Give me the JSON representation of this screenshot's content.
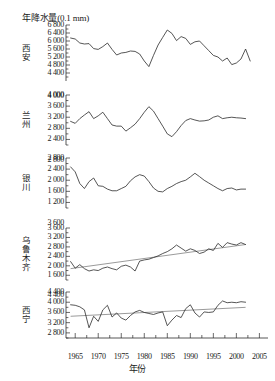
{
  "chart_data": {
    "type": "line",
    "title": "",
    "ylabel": "年降水量(0.1 mm)",
    "xlabel": "年份",
    "xlim": [
      1963,
      2006
    ],
    "x_ticks": [
      1965,
      1970,
      1975,
      1980,
      1985,
      1990,
      1995,
      2000,
      2005
    ],
    "x_minor_interval": 2.5,
    "grid": false,
    "legend": "none",
    "panels": [
      {
        "name": "西安",
        "ylim": [
          4000,
          6800
        ],
        "y_ticks": [
          4400,
          4800,
          5200,
          5600,
          6000,
          6400,
          6800
        ],
        "y_tick_labels": [
          "4 400",
          "4 800",
          "5 200",
          "5 600",
          "6 000",
          "6 400",
          "6 800"
        ],
        "extra_tick_label": "4 000",
        "trend_line": false,
        "x": [
          1964,
          1965,
          1966,
          1967,
          1968,
          1969,
          1970,
          1971,
          1972,
          1973,
          1974,
          1975,
          1976,
          1977,
          1978,
          1979,
          1980,
          1981,
          1982,
          1983,
          1984,
          1985,
          1986,
          1987,
          1988,
          1989,
          1990,
          1991,
          1992,
          1993,
          1994,
          1995,
          1996,
          1997,
          1998,
          1999,
          2000,
          2001,
          2002,
          2003
        ],
        "values": [
          6150,
          6100,
          5900,
          5850,
          5870,
          5620,
          5580,
          5720,
          5900,
          5580,
          5300,
          5400,
          5430,
          5500,
          5480,
          5350,
          5000,
          4720,
          5280,
          5800,
          6180,
          6550,
          6380,
          6020,
          6220,
          6130,
          5830,
          5960,
          6000,
          5760,
          5520,
          5280,
          5200,
          5000,
          5150,
          4820,
          4900,
          5100,
          5600,
          5000
        ]
      },
      {
        "name": "兰州",
        "ylim": [
          2200,
          4000
        ],
        "y_ticks": [
          2400,
          2800,
          3200,
          3600,
          4000
        ],
        "y_tick_labels": [
          "2 400",
          "2 800",
          "3 200",
          "3 600",
          "4 000"
        ],
        "extra_tick_label": "2 800",
        "trend_line": false,
        "x": [
          1964,
          1965,
          1966,
          1967,
          1968,
          1969,
          1970,
          1971,
          1972,
          1973,
          1974,
          1975,
          1976,
          1977,
          1978,
          1979,
          1980,
          1981,
          1982,
          1983,
          1984,
          1985,
          1986,
          1987,
          1988,
          1989,
          1990,
          1991,
          1992,
          1993,
          1994,
          1995,
          1996,
          1997,
          1998,
          1999,
          2000,
          2001,
          2002
        ],
        "values": [
          3050,
          2980,
          3150,
          3280,
          3400,
          3150,
          3250,
          3380,
          3150,
          2920,
          2880,
          2880,
          2700,
          2820,
          2950,
          3150,
          3380,
          3580,
          3420,
          3150,
          2880,
          2600,
          2500,
          2680,
          2900,
          3080,
          3150,
          3100,
          3060,
          3070,
          3100,
          3200,
          3250,
          3150,
          3180,
          3200,
          3180,
          3170,
          3150
        ]
      },
      {
        "name": "银川",
        "ylim": [
          1000,
          2800
        ],
        "y_ticks": [
          1200,
          1600,
          2000,
          2400,
          2800
        ],
        "y_tick_labels": [
          "1 200",
          "1 600",
          "2 000",
          "2 400",
          "2 800"
        ],
        "extra_tick_label": "3 600",
        "trend_line": false,
        "x": [
          1964,
          1965,
          1966,
          1967,
          1968,
          1969,
          1970,
          1971,
          1972,
          1973,
          1974,
          1975,
          1976,
          1977,
          1978,
          1979,
          1980,
          1981,
          1982,
          1983,
          1984,
          1985,
          1986,
          1987,
          1988,
          1989,
          1990,
          1991,
          1992,
          1993,
          1994,
          1995,
          1996,
          1997,
          1998,
          1999,
          2000,
          2001,
          2002
        ],
        "values": [
          2480,
          2300,
          1880,
          1700,
          1950,
          2080,
          1800,
          1780,
          1680,
          1620,
          1620,
          1700,
          1780,
          1980,
          2120,
          2200,
          2150,
          1950,
          1720,
          1600,
          1580,
          1700,
          1780,
          1880,
          1950,
          2000,
          2120,
          2250,
          2130,
          2000,
          1900,
          1800,
          1700,
          1620,
          1700,
          1720,
          1650,
          1680,
          1680
        ]
      },
      {
        "name": "乌鲁木齐",
        "ylim": [
          1400,
          3600
        ],
        "y_ticks": [
          1600,
          2000,
          2400,
          2800,
          3200,
          3600
        ],
        "y_tick_labels": [
          "1 600",
          "2 000",
          "2 400",
          "2 800",
          "3 200",
          "3 600"
        ],
        "extra_tick_label": "4 400",
        "trend_line": true,
        "trend_start": 1880,
        "trend_end": 2900,
        "x": [
          1964,
          1965,
          1966,
          1967,
          1968,
          1969,
          1970,
          1971,
          1972,
          1973,
          1974,
          1975,
          1976,
          1977,
          1978,
          1979,
          1980,
          1981,
          1982,
          1983,
          1984,
          1985,
          1986,
          1987,
          1988,
          1989,
          1990,
          1991,
          1992,
          1993,
          1994,
          1995,
          1996,
          1997,
          1998,
          1999,
          2000,
          2001,
          2002
        ],
        "values": [
          2180,
          1900,
          2050,
          1880,
          1780,
          1830,
          1800,
          1900,
          1950,
          1880,
          1830,
          1980,
          2030,
          1950,
          1780,
          2200,
          2250,
          2280,
          2350,
          2420,
          2520,
          2600,
          2720,
          2880,
          2750,
          2620,
          2720,
          2650,
          2520,
          2580,
          2720,
          2650,
          2950,
          2780,
          2980,
          2920,
          2880,
          2980,
          2900
        ]
      },
      {
        "name": "西宁",
        "ylim": [
          2600,
          4400
        ],
        "y_ticks": [
          2800,
          3200,
          3600,
          4000,
          4400
        ],
        "y_tick_labels": [
          "2 800",
          "3 200",
          "3 600",
          "4 000",
          "4 400"
        ],
        "extra_tick_label": "",
        "trend_line": true,
        "trend_start": 3450,
        "trend_end": 3800,
        "x": [
          1964,
          1965,
          1966,
          1967,
          1968,
          1969,
          1970,
          1971,
          1972,
          1973,
          1974,
          1975,
          1976,
          1977,
          1978,
          1979,
          1980,
          1981,
          1982,
          1983,
          1984,
          1985,
          1986,
          1987,
          1988,
          1989,
          1990,
          1991,
          1992,
          1993,
          1994,
          1995,
          1996,
          1997,
          1998,
          1999,
          2000,
          2001,
          2002
        ],
        "values": [
          3900,
          3880,
          3820,
          3700,
          3000,
          3450,
          3250,
          3700,
          3880,
          3420,
          3580,
          3380,
          3300,
          3480,
          3620,
          3680,
          3600,
          3560,
          3520,
          3580,
          3620,
          3080,
          3300,
          3480,
          3400,
          3750,
          3900,
          3580,
          3420,
          3620,
          3600,
          3620,
          3880,
          4050,
          3980,
          4000,
          3980,
          4020,
          4000
        ]
      }
    ]
  }
}
